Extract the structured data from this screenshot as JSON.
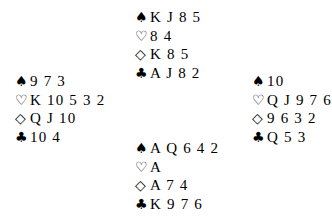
{
  "symbols": {
    "spades": "♠",
    "hearts": "♡",
    "diamonds": "◇",
    "clubs": "♣"
  },
  "hands": {
    "north": {
      "spades": "K J 8 5",
      "hearts": "8 4",
      "diamonds": "K 8 5",
      "clubs": "A J 8 2"
    },
    "west": {
      "spades": "9 7 3",
      "hearts": "K 10 5 3 2",
      "diamonds": "Q J 10",
      "clubs": "10 4"
    },
    "east": {
      "spades": "10",
      "hearts": "Q J 9 7 6",
      "diamonds": "9 6 3 2",
      "clubs": "Q 5 3"
    },
    "south": {
      "spades": "A Q 6 4 2",
      "hearts": "A",
      "diamonds": "A 7 4",
      "clubs": "K 9 7 6"
    }
  }
}
